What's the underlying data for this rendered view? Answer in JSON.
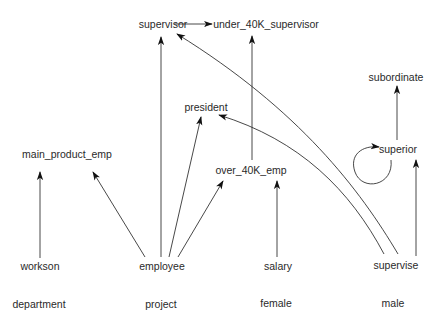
{
  "diagram": {
    "type": "directed-graph",
    "colors": {
      "background": "#ffffff",
      "edge": "#333333",
      "text": "#2a2a2a"
    },
    "nodes": [
      {
        "id": "supervisor",
        "label": "supervisor",
        "x": 163,
        "y": 24
      },
      {
        "id": "under_40K_supervisor",
        "label": "under_40K_supervisor",
        "x": 266,
        "y": 24
      },
      {
        "id": "subordinate",
        "label": "subordinate",
        "x": 396,
        "y": 77
      },
      {
        "id": "president",
        "label": "president",
        "x": 206,
        "y": 107
      },
      {
        "id": "main_product_emp",
        "label": "main_product_emp",
        "x": 67,
        "y": 154
      },
      {
        "id": "superior",
        "label": "superior",
        "x": 398,
        "y": 149
      },
      {
        "id": "over_40K_emp",
        "label": "over_40K_emp",
        "x": 251,
        "y": 170
      },
      {
        "id": "workson",
        "label": "workson",
        "x": 40,
        "y": 266
      },
      {
        "id": "employee",
        "label": "employee",
        "x": 162,
        "y": 266
      },
      {
        "id": "salary",
        "label": "salary",
        "x": 278,
        "y": 266
      },
      {
        "id": "supervise",
        "label": "supervise",
        "x": 396,
        "y": 265
      },
      {
        "id": "department",
        "label": "department",
        "x": 39,
        "y": 304
      },
      {
        "id": "project",
        "label": "project",
        "x": 161,
        "y": 304
      },
      {
        "id": "female",
        "label": "female",
        "x": 276,
        "y": 303
      },
      {
        "id": "male",
        "label": "male",
        "x": 393,
        "y": 303
      }
    ],
    "edges": [
      {
        "from": "supervisor",
        "to": "under_40K_supervisor"
      },
      {
        "from": "workson",
        "to": "main_product_emp"
      },
      {
        "from": "employee",
        "to": "main_product_emp"
      },
      {
        "from": "employee",
        "to": "supervisor"
      },
      {
        "from": "employee",
        "to": "president"
      },
      {
        "from": "employee",
        "to": "over_40K_emp"
      },
      {
        "from": "salary",
        "to": "over_40K_emp"
      },
      {
        "from": "over_40K_emp",
        "to": "under_40K_supervisor"
      },
      {
        "from": "supervise",
        "to": "supervisor"
      },
      {
        "from": "supervise",
        "to": "president"
      },
      {
        "from": "supervise",
        "to": "superior"
      },
      {
        "from": "superior",
        "to": "subordinate"
      },
      {
        "from": "superior",
        "to": "superior"
      }
    ]
  }
}
